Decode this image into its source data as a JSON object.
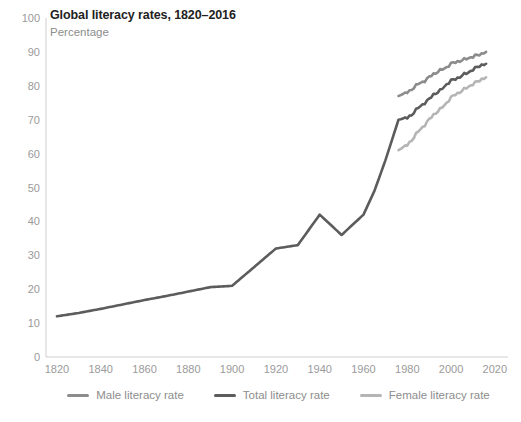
{
  "header": {
    "title": "Global literacy rates, 1820–2016",
    "subtitle": "Percentage"
  },
  "colors": {
    "male": "#8c8c8c",
    "total": "#5c5c5c",
    "female": "#b5b5b5",
    "axis": "#cfcfcf",
    "tick_label": "#9a9a9a",
    "title": "#222222",
    "subtitle": "#8d8d8d",
    "background": "#ffffff"
  },
  "legend": {
    "position": "bottom-center",
    "items": [
      {
        "label": "Male literacy rate",
        "color": "#8c8c8c"
      },
      {
        "label": "Total literacy rate",
        "color": "#5c5c5c"
      },
      {
        "label": "Female literacy rate",
        "color": "#b5b5b5"
      }
    ]
  },
  "y_axis": {
    "label": "",
    "min": 0,
    "max": 100,
    "step": 10,
    "ticks": [
      "0",
      "10",
      "20",
      "30",
      "40",
      "50",
      "60",
      "70",
      "80",
      "90",
      "100"
    ]
  },
  "x_axis": {
    "label": "",
    "min": 1815,
    "max": 2026,
    "ticks": [
      "1820",
      "1840",
      "1860",
      "1880",
      "1900",
      "1920",
      "1940",
      "1960",
      "1980",
      "2000",
      "2020"
    ]
  },
  "chart_data": {
    "type": "line",
    "title": "Global literacy rates, 1820–2016",
    "subtitle": "Percentage",
    "xlabel": "",
    "ylabel": "Percentage",
    "xlim": [
      1815,
      2026
    ],
    "ylim": [
      0,
      100
    ],
    "grid": false,
    "legend_position": "bottom-center",
    "series": [
      {
        "name": "Total literacy rate",
        "color": "#5c5c5c",
        "points": [
          [
            1820,
            12.0
          ],
          [
            1830,
            13.0
          ],
          [
            1840,
            14.2
          ],
          [
            1850,
            15.5
          ],
          [
            1860,
            16.8
          ],
          [
            1870,
            18.0
          ],
          [
            1880,
            19.3
          ],
          [
            1890,
            20.6
          ],
          [
            1900,
            21.0
          ],
          [
            1910,
            26.5
          ],
          [
            1920,
            32.0
          ],
          [
            1930,
            33.0
          ],
          [
            1940,
            42.0
          ],
          [
            1950,
            36.0
          ],
          [
            1960,
            42.0
          ],
          [
            1965,
            49.0
          ],
          [
            1970,
            58.0
          ],
          [
            1976,
            70.0
          ],
          [
            1980,
            70.5
          ],
          [
            1982,
            71.5
          ],
          [
            1985,
            73.5
          ],
          [
            1988,
            75.0
          ],
          [
            1990,
            76.0
          ],
          [
            1992,
            77.5
          ],
          [
            1995,
            78.5
          ],
          [
            1998,
            80.5
          ],
          [
            2000,
            81.5
          ],
          [
            2002,
            82.0
          ],
          [
            2005,
            83.0
          ],
          [
            2008,
            84.0
          ],
          [
            2010,
            84.8
          ],
          [
            2012,
            85.5
          ],
          [
            2014,
            86.2
          ],
          [
            2016,
            86.5
          ]
        ]
      },
      {
        "name": "Male literacy rate",
        "color": "#8c8c8c",
        "points": [
          [
            1976,
            77.0
          ],
          [
            1980,
            78.0
          ],
          [
            1982,
            79.0
          ],
          [
            1985,
            80.5
          ],
          [
            1988,
            81.5
          ],
          [
            1990,
            82.5
          ],
          [
            1992,
            83.5
          ],
          [
            1995,
            84.5
          ],
          [
            1998,
            85.5
          ],
          [
            2000,
            86.5
          ],
          [
            2002,
            87.0
          ],
          [
            2005,
            87.5
          ],
          [
            2008,
            88.2
          ],
          [
            2010,
            88.6
          ],
          [
            2012,
            89.0
          ],
          [
            2014,
            89.5
          ],
          [
            2016,
            90.0
          ]
        ]
      },
      {
        "name": "Female literacy rate",
        "color": "#b5b5b5",
        "points": [
          [
            1976,
            61.0
          ],
          [
            1980,
            62.5
          ],
          [
            1982,
            64.0
          ],
          [
            1985,
            66.5
          ],
          [
            1988,
            68.5
          ],
          [
            1990,
            70.0
          ],
          [
            1992,
            71.5
          ],
          [
            1995,
            73.0
          ],
          [
            1998,
            75.0
          ],
          [
            2000,
            76.5
          ],
          [
            2002,
            77.5
          ],
          [
            2005,
            78.5
          ],
          [
            2008,
            79.8
          ],
          [
            2010,
            80.5
          ],
          [
            2012,
            81.2
          ],
          [
            2014,
            82.0
          ],
          [
            2016,
            82.5
          ]
        ]
      }
    ]
  }
}
